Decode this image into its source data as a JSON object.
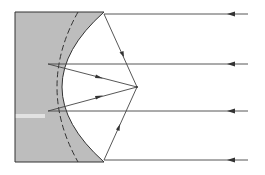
{
  "diagram": {
    "colors": {
      "substrate_fill": "#bdbdbd",
      "highlight_band": "#e2e2e2",
      "line": "#333333",
      "background": "#ffffff"
    },
    "elements": {
      "substrate": {
        "x": 15,
        "y": 12,
        "bottom": 162,
        "label": ""
      },
      "parabolic_mirror": {
        "vertex": [
          40,
          87
        ],
        "top_end": [
          104,
          12
        ],
        "bottom_end": [
          104,
          162
        ]
      },
      "reference_circle": {
        "style": "dashed",
        "top": [
          78,
          12
        ],
        "leftmost": [
          50,
          87
        ],
        "bottom": [
          78,
          162
        ]
      },
      "focal_point": [
        137,
        87
      ],
      "incoming_rays": [
        {
          "y": 14,
          "hit_x": 104,
          "direction": "right-to-left"
        },
        {
          "y": 64,
          "hit_x": 48,
          "direction": "right-to-left"
        },
        {
          "y": 111,
          "hit_x": 48,
          "direction": "right-to-left"
        },
        {
          "y": 160,
          "hit_x": 104,
          "direction": "right-to-left"
        }
      ],
      "ray_start_x": 248
    }
  }
}
